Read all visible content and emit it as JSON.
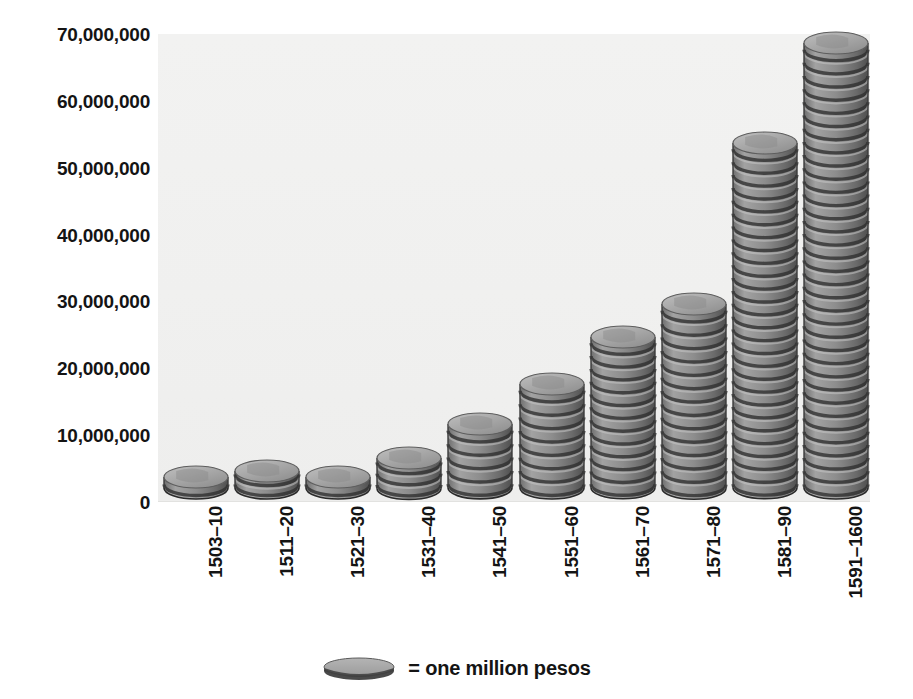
{
  "chart_data": {
    "type": "bar",
    "title": "",
    "subtitle": "",
    "xlabel": "",
    "ylabel": "",
    "categories": [
      "1503–10",
      "1511–20",
      "1521–30",
      "1531–40",
      "1541–50",
      "1551–60",
      "1561–70",
      "1571–80",
      "1581–90",
      "1591–1600"
    ],
    "values": [
      2000000,
      3000000,
      2000000,
      5000000,
      10000000,
      16000000,
      23000000,
      28000000,
      52000000,
      67000000
    ],
    "ylim": [
      0,
      70000000
    ],
    "ytick_values": [
      0,
      10000000,
      20000000,
      30000000,
      40000000,
      50000000,
      60000000,
      70000000
    ],
    "ytick_labels": [
      "0",
      "10,000,000",
      "20,000,000",
      "30,000,000",
      "40,000,000",
      "50,000,000",
      "60,000,000",
      "70,000,000"
    ],
    "grid": false,
    "legend_position": "bottom-center",
    "legend_entries": [
      {
        "marker": "coin-glyph",
        "label": "= one million pesos"
      }
    ],
    "series": [
      {
        "name": "silver imports",
        "unit": "pesos",
        "values": [
          2000000,
          3000000,
          2000000,
          5000000,
          10000000,
          16000000,
          23000000,
          28000000,
          52000000,
          67000000
        ]
      }
    ],
    "bar_style": "stacked-coin-pictogram",
    "unit_per_coin": 1000000,
    "colors": {
      "coin_face": "#9b9b9b",
      "coin_top": "#a8a8a8",
      "coin_edge": "#3b3b3b",
      "plot_background": "#f0f0ef",
      "text": "#141414"
    }
  },
  "legend": {
    "equals_text": "= one million pesos",
    "coin_icon": "coin-icon"
  },
  "axis": {
    "y_labels": [
      "70,000,000",
      "60,000,000",
      "50,000,000",
      "40,000,000",
      "30,000,000",
      "20,000,000",
      "10,000,000",
      "0"
    ],
    "x_labels": [
      "1503–10",
      "1511–20",
      "1521–30",
      "1531–40",
      "1541–50",
      "1551–60",
      "1561–70",
      "1571–80",
      "1581–90",
      "1591–1600"
    ]
  }
}
